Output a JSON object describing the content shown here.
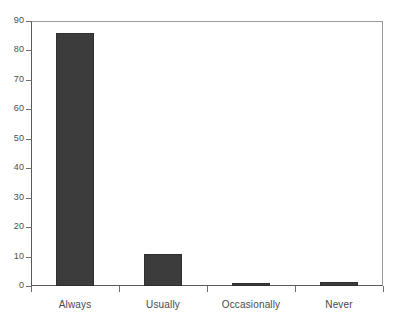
{
  "chart_data": {
    "type": "bar",
    "title": "",
    "subtitle": "",
    "xlabel": "",
    "ylabel": "",
    "categories": [
      "Always",
      "Usually",
      "Occasionally",
      "Never"
    ],
    "values": [
      86,
      11,
      1,
      1.5
    ],
    "series": [
      {
        "name": "Percent of respondents",
        "values": [
          86,
          11,
          1,
          1.5
        ]
      }
    ],
    "ylim": [
      0,
      90
    ],
    "yticks": [
      0,
      10,
      20,
      30,
      40,
      50,
      60,
      70,
      80,
      90
    ],
    "ytick_labels": [
      "0",
      "10",
      "20",
      "30",
      "40",
      "50",
      "60",
      "70",
      "80",
      "90"
    ],
    "grid": false,
    "legend": false,
    "legend_position": "none",
    "bar_color": "#3c3c3c",
    "axis_color": "#58595b",
    "background_color": "#ffffff",
    "annotations": []
  }
}
